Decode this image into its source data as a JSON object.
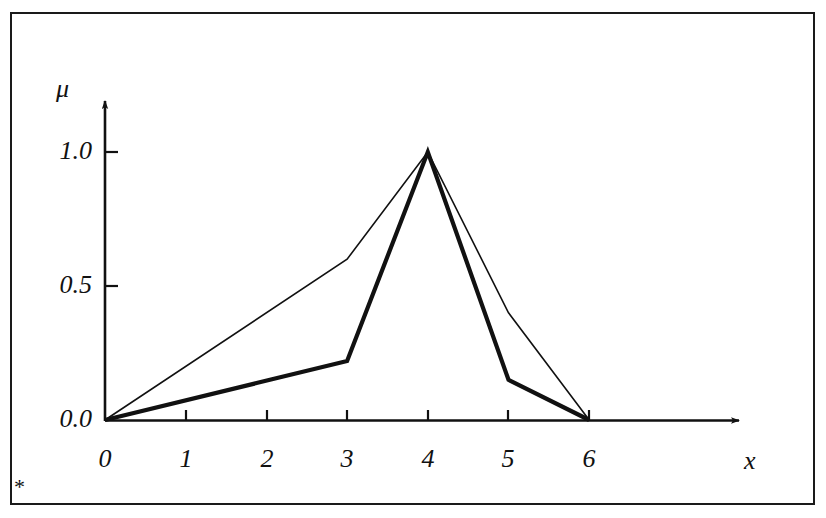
{
  "figure": {
    "footnote_marker": "*",
    "frame_color": "#1a1a1a",
    "background_color": "#ffffff"
  },
  "axes": {
    "y_axis_title": "μ",
    "x_axis_title": "x",
    "y_tick_labels": [
      "0.0",
      "0.5",
      "1.0"
    ],
    "x_tick_labels": [
      "0",
      "1",
      "2",
      "3",
      "4",
      "5",
      "6"
    ]
  },
  "chart_data": {
    "type": "line",
    "title": "",
    "subtitle": "",
    "xlabel": "x",
    "ylabel": "μ",
    "xlim": [
      0,
      6
    ],
    "ylim": [
      0.0,
      1.0
    ],
    "xticks": [
      0,
      1,
      2,
      3,
      4,
      5,
      6
    ],
    "xticklabels": [
      "0",
      "1",
      "2",
      "3",
      "4",
      "5",
      "6"
    ],
    "yticks": [
      0.0,
      0.5,
      1.0
    ],
    "yticklabels": [
      "0.0",
      "0.5",
      "1.0"
    ],
    "grid": false,
    "legend": null,
    "axis_style": "arrow-tipped open axes",
    "annotations": [],
    "series": [
      {
        "name": "thin-membership-curve",
        "line_width": 1,
        "color": "#111111",
        "x": [
          0,
          3,
          4,
          5,
          6
        ],
        "values": [
          0.0,
          0.6,
          1.0,
          0.4,
          0.0
        ]
      },
      {
        "name": "thick-membership-curve",
        "line_width": 3,
        "color": "#111111",
        "x": [
          0,
          3,
          4,
          5,
          6
        ],
        "values": [
          0.0,
          0.22,
          1.0,
          0.15,
          0.0
        ]
      }
    ]
  }
}
